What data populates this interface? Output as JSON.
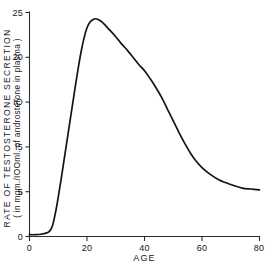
{
  "figure": {
    "background_color": "#ffffff",
    "line_color": "#141414",
    "axis_color": "#2b2b2b"
  },
  "labels": {
    "y_axis_line1": "RATE  OF  TESTOSTERONE   SECRETION",
    "y_axis_line2": "( in mgm./IOOml. of androsterone in plasma )",
    "x_axis_title": "AGE",
    "x_tick_0": "0",
    "x_tick_20": "20",
    "x_tick_40": "40",
    "x_tick_60": "60",
    "x_tick_80": "80",
    "y_tick_0": "0",
    "y_tick_5": "5",
    "y_tick_10": "IO",
    "y_tick_15": "I5",
    "y_tick_20": "20",
    "y_tick_25": "25"
  },
  "chart_data": {
    "type": "line",
    "title": "",
    "subtitle": "",
    "xlabel": "AGE",
    "ylabel": "RATE OF TESTOSTERONE SECRETION ( in mgm./IOOml. of androsterone in plasma )",
    "xlim": [
      0,
      80
    ],
    "ylim": [
      0,
      25
    ],
    "xticks": [
      0,
      20,
      40,
      60,
      80
    ],
    "yticks": [
      0,
      5,
      10,
      15,
      20,
      25
    ],
    "ytick_labels": [
      "0",
      "5",
      "IO",
      "I5",
      "20",
      "25"
    ],
    "grid": false,
    "legend": false,
    "legend_position": "none",
    "annotations": [],
    "series": [
      {
        "name": "Rate of testosterone secretion",
        "x": [
          0,
          2,
          4,
          6,
          7,
          8,
          9,
          10,
          11,
          12,
          13,
          14,
          15,
          16,
          17,
          18,
          19,
          20,
          21,
          22,
          23,
          24,
          25,
          26,
          28,
          30,
          32,
          34,
          36,
          38,
          40,
          42,
          44,
          46,
          48,
          50,
          52,
          54,
          56,
          58,
          60,
          63,
          66,
          70,
          74,
          77,
          80
        ],
        "y": [
          0.2,
          0.2,
          0.25,
          0.4,
          0.6,
          1.2,
          2.6,
          4.4,
          6.4,
          8.5,
          10.6,
          12.7,
          14.8,
          16.9,
          18.9,
          20.7,
          22.2,
          23.3,
          23.9,
          24.2,
          24.3,
          24.2,
          24.0,
          23.7,
          23.0,
          22.3,
          21.5,
          20.8,
          20.0,
          19.2,
          18.5,
          17.6,
          16.6,
          15.5,
          14.2,
          12.9,
          11.6,
          10.4,
          9.3,
          8.4,
          7.7,
          6.9,
          6.3,
          5.8,
          5.4,
          5.3,
          5.2
        ]
      }
    ]
  }
}
